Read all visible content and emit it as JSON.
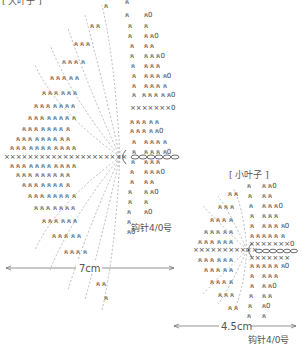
{
  "big_leaf": {
    "title": "[ 大叶子 ]",
    "width_label": "7cm",
    "hook_label": "钩针4/0号"
  },
  "small_leaf": {
    "title": "[ 小叶子 ]",
    "width_label": "4.5cm",
    "hook_label": "钩针4/0号"
  },
  "symbols": {
    "single_crochet": "×",
    "sc_back_loop": "ጸ",
    "increase": "ጸ0",
    "chain": "○"
  },
  "colors": {
    "symbol": "#444444",
    "dashed": "#999999",
    "text": "#555555"
  }
}
